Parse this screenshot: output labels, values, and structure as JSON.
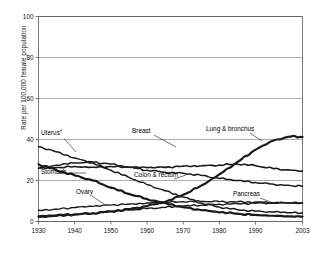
{
  "chart_data": {
    "type": "line",
    "title": "",
    "subtitle": "",
    "xlabel": "",
    "ylabel": "Rate per 100,000 female population",
    "xlim": [
      1930,
      2003
    ],
    "ylim": [
      0,
      100
    ],
    "xticks": [
      "1930",
      "1940",
      "1950",
      "1960",
      "1970",
      "1980",
      "1990",
      "2003"
    ],
    "xtick_values": [
      1930,
      1940,
      1950,
      1960,
      1970,
      1980,
      1990,
      2003
    ],
    "yticks": [
      "0",
      "20",
      "40",
      "60",
      "80",
      "100"
    ],
    "ytick_values": [
      0,
      20,
      40,
      60,
      80,
      100
    ],
    "grid": "horizontal",
    "legend": "inline-annotations",
    "annotations": [
      {
        "name": "uterus-label",
        "text": "Uterus",
        "dagger": "†",
        "x": 41,
        "y": 135
      },
      {
        "name": "breast-label",
        "text": "Breast",
        "x": 132,
        "y": 133
      },
      {
        "name": "lung-label",
        "text": "Lung & bronchus",
        "x": 206,
        "y": 131
      },
      {
        "name": "stomach-label",
        "text": "Stomach",
        "x": 41,
        "y": 174
      },
      {
        "name": "colon-label",
        "text": "Colon & rectum",
        "x": 134,
        "y": 177
      },
      {
        "name": "ovary-label",
        "text": "Ovary",
        "x": 76,
        "y": 194
      },
      {
        "name": "pancreas-label",
        "text": "Pancreas",
        "x": 233,
        "y": 196
      }
    ],
    "x": [
      1930,
      1935,
      1940,
      1945,
      1950,
      1955,
      1960,
      1965,
      1970,
      1975,
      1980,
      1985,
      1990,
      1995,
      2000,
      2003
    ],
    "series": [
      {
        "name": "Uterus",
        "values": [
          36.5,
          34.0,
          31.0,
          28.5,
          25.0,
          21.5,
          18.0,
          15.0,
          12.0,
          9.0,
          7.0,
          5.8,
          5.0,
          4.6,
          4.3,
          4.2
        ]
      },
      {
        "name": "Stomach",
        "values": [
          28.0,
          25.0,
          22.5,
          20.0,
          16.5,
          13.5,
          11.0,
          9.0,
          7.0,
          5.5,
          4.5,
          3.8,
          3.2,
          2.8,
          2.5,
          2.4
        ]
      },
      {
        "name": "Breast",
        "values": [
          26.0,
          26.3,
          26.8,
          26.5,
          26.8,
          26.5,
          26.3,
          26.4,
          27.0,
          27.2,
          27.5,
          28.0,
          27.2,
          25.8,
          25.0,
          24.6
        ]
      },
      {
        "name": "Colon & rectum",
        "values": [
          26.0,
          27.5,
          28.5,
          29.0,
          28.0,
          26.5,
          25.0,
          24.0,
          23.5,
          22.5,
          21.0,
          20.0,
          19.0,
          18.2,
          17.5,
          17.2
        ]
      },
      {
        "name": "Lung & bronchus",
        "values": [
          2.5,
          3.0,
          3.5,
          4.0,
          5.0,
          6.0,
          7.5,
          9.5,
          13.0,
          17.5,
          23.0,
          29.0,
          35.0,
          39.5,
          41.5,
          41.2
        ]
      },
      {
        "name": "Ovary",
        "values": [
          5.5,
          6.0,
          6.8,
          7.4,
          8.0,
          8.5,
          9.0,
          9.4,
          9.6,
          9.8,
          9.7,
          9.6,
          9.5,
          9.2,
          9.0,
          8.9
        ]
      },
      {
        "name": "Pancreas",
        "values": [
          2.0,
          2.6,
          3.3,
          4.0,
          4.8,
          5.6,
          6.3,
          6.9,
          7.5,
          8.0,
          8.4,
          8.7,
          8.9,
          9.0,
          9.1,
          9.1
        ]
      }
    ]
  }
}
